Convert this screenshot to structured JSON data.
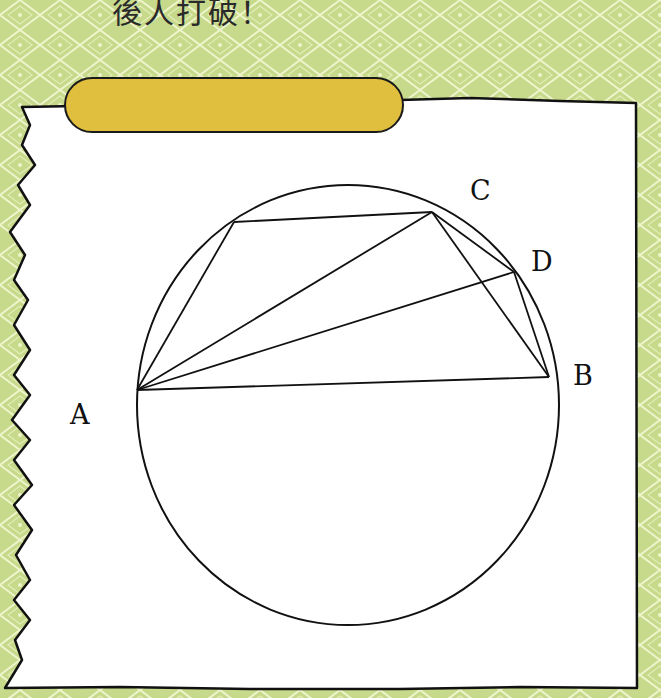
{
  "header": {
    "text": "後人打破！"
  },
  "banner": {
    "label": "",
    "color": "#e0bf3e"
  },
  "colors": {
    "background": "#c7d98a",
    "pattern_line": "#e9f2c2",
    "paper": "#ffffff",
    "ink": "#111111"
  },
  "diagram": {
    "type": "circle-inscribed-quadrilaterals",
    "circle": {
      "cx": 348,
      "cy": 405,
      "rx": 211,
      "ry": 220
    },
    "points": {
      "A": {
        "x": 137,
        "y": 390,
        "label": "A",
        "label_x": 70,
        "label_y": 401
      },
      "B": {
        "x": 549,
        "y": 377,
        "label": "B",
        "label_x": 573,
        "label_y": 362
      },
      "C": {
        "x": 432,
        "y": 212,
        "label": "C",
        "label_x": 470,
        "label_y": 177
      },
      "D": {
        "x": 514,
        "y": 272,
        "label": "D",
        "label_x": 531,
        "label_y": 248
      },
      "E": {
        "x": 234,
        "y": 222,
        "label": ""
      }
    },
    "segments": [
      [
        "A",
        "B"
      ],
      [
        "A",
        "E"
      ],
      [
        "E",
        "C"
      ],
      [
        "A",
        "C"
      ],
      [
        "A",
        "D"
      ],
      [
        "C",
        "D"
      ],
      [
        "C",
        "B"
      ],
      [
        "D",
        "B"
      ]
    ]
  }
}
